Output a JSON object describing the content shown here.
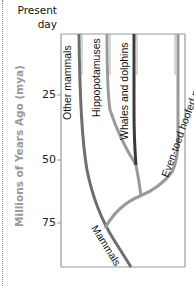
{
  "axis": {
    "title": "Millions of Years Ago (mya)",
    "top_label_line1": "Present",
    "top_label_line2": "day",
    "ticks": [
      {
        "label": "25",
        "y": 95
      },
      {
        "label": "50",
        "y": 160
      },
      {
        "label": "75",
        "y": 223
      }
    ]
  },
  "lineages": [
    {
      "label": "Other mammals",
      "color": "#6e6e6e"
    },
    {
      "label": "Hippopotamuses",
      "color": "#9a9a9a"
    },
    {
      "label": "Whales and dolphins",
      "color": "#3a3a3a"
    },
    {
      "label": "Even-toed hoofed mammals",
      "color": "#9a9a9a"
    }
  ],
  "root": {
    "label": "Mammals",
    "color": "#6e6e6e"
  },
  "colors": {
    "frame": "#999999",
    "axis_title": "#9a9a9a"
  }
}
